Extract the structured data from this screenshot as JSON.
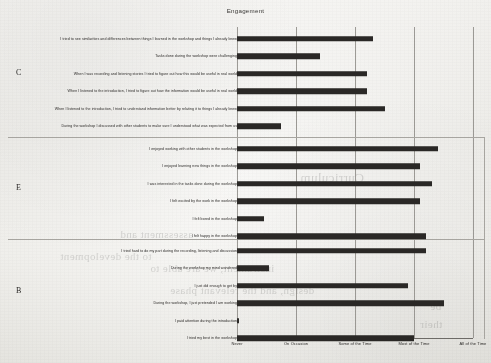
{
  "chart_data": {
    "type": "bar",
    "orientation": "horizontal",
    "title": "Engagement",
    "xlabel": "",
    "ylabel": "",
    "grid": true,
    "legend": "none",
    "xlim": [
      0,
      4
    ],
    "xticks": [
      0,
      1,
      2,
      3,
      4
    ],
    "xticklabels": [
      "Never",
      "On Occasion",
      "Some of the Time",
      "Most of the Time",
      "All of the Time"
    ],
    "groups": [
      {
        "label": "C",
        "categories": [
          "I tried to see similarities and differences between things I learned in the workshop and things I already knew",
          "Tasks done during the workshop were challenging",
          "When I was recording and listening stories I tried to figure out how this would be useful in real world",
          "When I listened to the introduction, I tried to figure out how the information would be useful in real world",
          "When I listened to the introduction, I tried to understand information better by relating it to things I already knew",
          "During the workshop I discussed with other students to make sure I understood what was expected from us"
        ],
        "values": [
          2.3,
          1.4,
          2.2,
          2.2,
          2.5,
          0.75
        ]
      },
      {
        "label": "E",
        "categories": [
          "I enjoyed working with other students in the workshop",
          "I enjoyed learning new things in the workshop",
          "I was interested in the tasks done during the workshop",
          "I felt excited by the work in the workshop",
          "I felt bored in the workshop",
          "I felt happy in the workshop"
        ],
        "values": [
          3.4,
          3.1,
          3.3,
          3.1,
          0.45,
          3.2
        ]
      },
      {
        "label": "B",
        "categories": [
          "I tried hard to do my part during the recording, listening and discussion",
          "During the workshop my mind wandered",
          "I just did enough to get by",
          "During the workshop, I just pretended I am working",
          "I paid attention during the introduction",
          "I tried my best in the workshop"
        ],
        "values": [
          3.2,
          0.55,
          2.9,
          3.5,
          0.03,
          3.0
        ]
      }
    ],
    "bar_color": "#2a2826"
  },
  "ghost_text": [
    {
      "text": "Curriculum",
      "left": 300,
      "top": 170,
      "size": 13
    },
    {
      "text": "assessment and",
      "left": 120,
      "top": 228,
      "size": 11
    },
    {
      "text": "to the development",
      "left": 60,
      "top": 250,
      "size": 11
    },
    {
      "text": "instrument, we are able to",
      "left": 150,
      "top": 262,
      "size": 11
    },
    {
      "text": "design, and the relevant phase",
      "left": 170,
      "top": 284,
      "size": 11
    },
    {
      "text": "be",
      "left": 430,
      "top": 300,
      "size": 11
    },
    {
      "text": "their",
      "left": 420,
      "top": 318,
      "size": 11
    }
  ]
}
